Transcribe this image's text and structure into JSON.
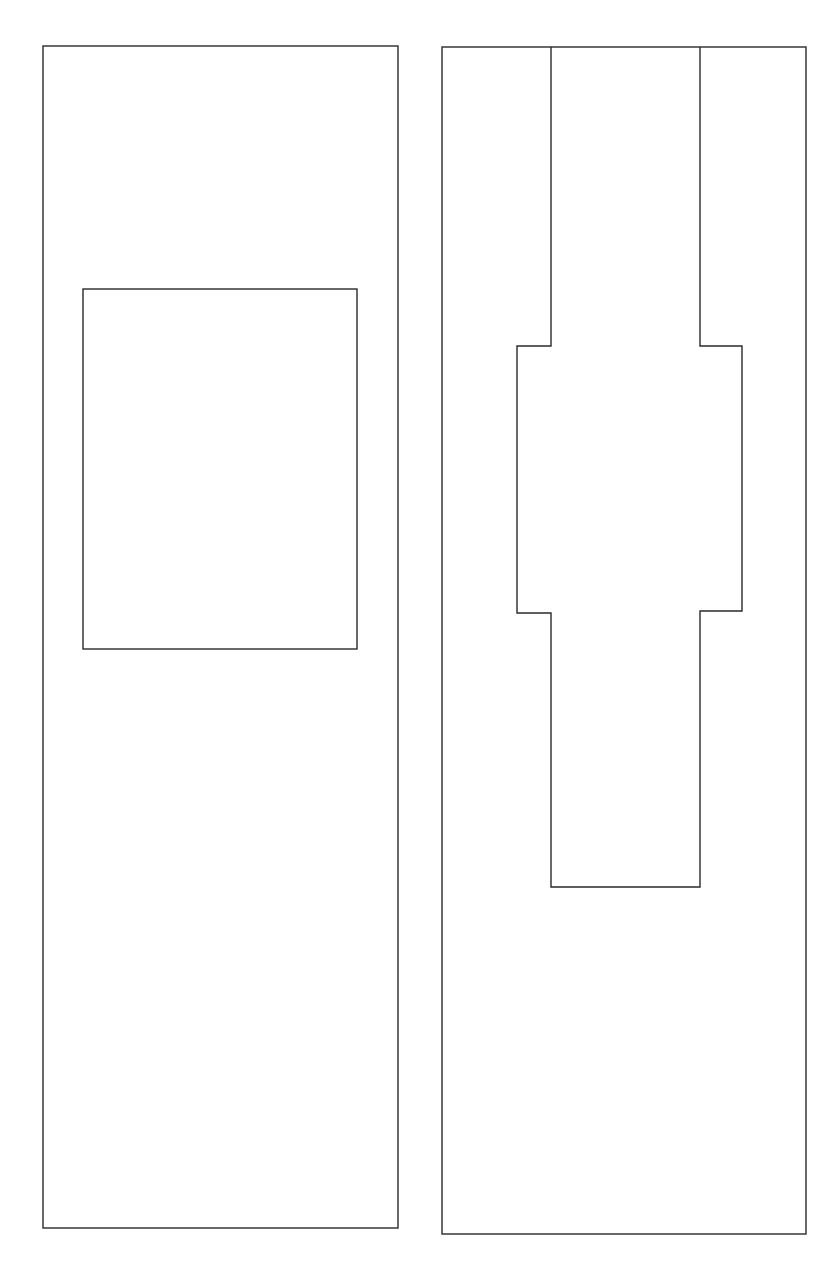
{
  "canvas": {
    "width": 837,
    "height": 1279,
    "background": "#ffffff"
  },
  "style": {
    "stroke": "#2a2a2a"
  },
  "diagram": {
    "shapes": [
      {
        "id": "left-outer-rect",
        "type": "rect",
        "x": 43,
        "y": 46,
        "width": 355,
        "height": 1182
      },
      {
        "id": "left-inner-rect",
        "type": "rect",
        "x": 83,
        "y": 289,
        "width": 274,
        "height": 360
      },
      {
        "id": "right-outer-rect",
        "type": "rect",
        "x": 442,
        "y": 47,
        "width": 364,
        "height": 1187
      },
      {
        "id": "right-notch-cutout",
        "type": "polygon",
        "points": "551,47 551,346 517,346 517,613 551,613 551,887 700,887 700,611 742,611 742,346 700,346 700,47"
      }
    ]
  }
}
